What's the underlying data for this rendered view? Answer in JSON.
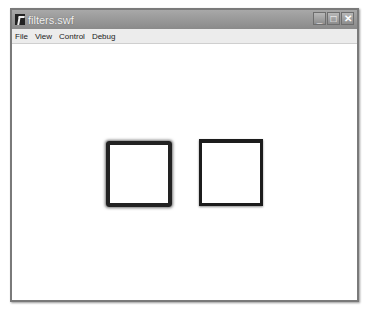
{
  "window": {
    "title": "filters.swf",
    "icon": "flash-player-icon",
    "controls": {
      "minimize": "_",
      "maximize": "□",
      "close": "✕"
    }
  },
  "menubar": {
    "items": [
      {
        "label": "File"
      },
      {
        "label": "View"
      },
      {
        "label": "Control"
      },
      {
        "label": "Debug"
      }
    ]
  },
  "stage": {
    "shapes": [
      {
        "name": "blurred-square",
        "stroke": "#222222"
      },
      {
        "name": "shadowed-square",
        "stroke": "#1c1c1c"
      }
    ]
  }
}
